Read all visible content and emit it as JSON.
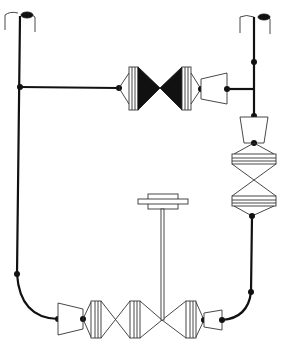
{
  "diagram": {
    "type": "piping-schematic",
    "colors": {
      "pipe": "#111111",
      "outline": "#333333",
      "background": "#ffffff",
      "closed_valve_fill": "#111111"
    },
    "components": [
      {
        "id": "vent-left",
        "kind": "vent-cap"
      },
      {
        "id": "vent-right",
        "kind": "vent-cap"
      },
      {
        "id": "valve-top",
        "kind": "gate-valve",
        "state": "closed"
      },
      {
        "id": "reducer-top",
        "kind": "reducer"
      },
      {
        "id": "reducer-right",
        "kind": "reducer"
      },
      {
        "id": "valve-right",
        "kind": "gate-valve",
        "state": "open"
      },
      {
        "id": "reducer-bottom-left",
        "kind": "reducer"
      },
      {
        "id": "valve-bottom-1",
        "kind": "gate-valve",
        "state": "open"
      },
      {
        "id": "valve-bottom-2",
        "kind": "gate-valve",
        "state": "open"
      },
      {
        "id": "reducer-bottom-right",
        "kind": "reducer"
      },
      {
        "id": "valve-stem-handwheel",
        "kind": "actuator-stem"
      }
    ]
  }
}
